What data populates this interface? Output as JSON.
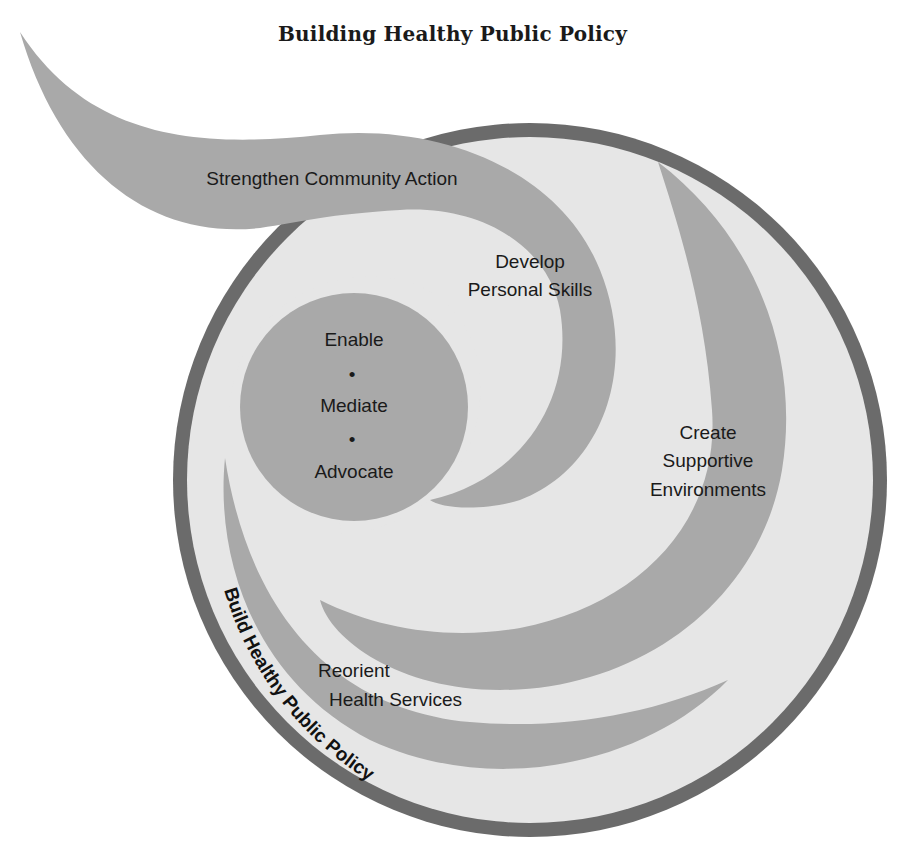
{
  "title": "Building Healthy Public Policy",
  "colors": {
    "outer_ring": "#6b6b6b",
    "inner_fill": "#e6e6e6",
    "swoosh": "#a9a9a9",
    "text": "#1a1a1a",
    "background": "#ffffff"
  },
  "labels": {
    "strengthen": "Strengthen Community Action",
    "develop_line1": "Develop",
    "develop_line2": "Personal Skills",
    "center_enable": "Enable",
    "center_bullet": "•",
    "center_mediate": "Mediate",
    "center_advocate": "Advocate",
    "create_line1": "Create",
    "create_line2": "Supportive",
    "create_line3": "Environments",
    "reorient_line1": "Reorient",
    "reorient_line2": "Health Services",
    "ring_label": "Build Healthy Public Policy"
  }
}
